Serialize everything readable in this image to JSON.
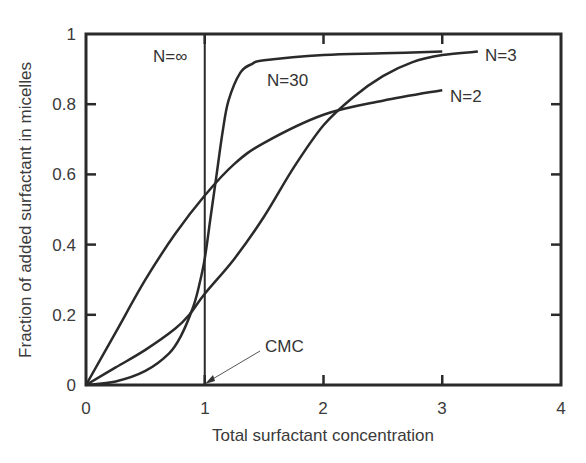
{
  "chart_data": {
    "type": "line",
    "title": "",
    "xlabel": "Total surfactant concentration",
    "ylabel": "Fraction of added surfactant in micelles",
    "xlim": [
      0,
      4
    ],
    "ylim": [
      0,
      1
    ],
    "xticks": [
      "0",
      "1",
      "2",
      "3",
      "4"
    ],
    "yticks": [
      "0",
      "0.2",
      "0.4",
      "0.6",
      "0.8",
      "1"
    ],
    "grid": false,
    "legend": "inline labels",
    "series": [
      {
        "name": "N=2",
        "x": [
          0,
          0.25,
          0.5,
          0.75,
          1.0,
          1.25,
          1.5,
          2.0,
          2.5,
          3.0
        ],
        "y": [
          0,
          0.15,
          0.3,
          0.43,
          0.54,
          0.63,
          0.69,
          0.77,
          0.81,
          0.84
        ]
      },
      {
        "name": "N=3",
        "x": [
          0,
          0.25,
          0.5,
          0.75,
          0.87,
          1.0,
          1.25,
          1.5,
          1.75,
          2.0,
          2.25,
          2.5,
          2.75,
          3.0,
          3.3
        ],
        "y": [
          0,
          0.05,
          0.1,
          0.16,
          0.2,
          0.26,
          0.36,
          0.48,
          0.62,
          0.74,
          0.82,
          0.88,
          0.92,
          0.94,
          0.95
        ]
      },
      {
        "name": "N=30",
        "x": [
          0,
          0.25,
          0.5,
          0.7,
          0.8,
          0.9,
          0.95,
          1.0,
          1.05,
          1.1,
          1.15,
          1.2,
          1.3,
          1.4,
          1.5,
          2.0,
          2.5,
          3.0
        ],
        "y": [
          0,
          0.01,
          0.04,
          0.09,
          0.14,
          0.22,
          0.28,
          0.36,
          0.48,
          0.6,
          0.72,
          0.81,
          0.89,
          0.915,
          0.925,
          0.94,
          0.945,
          0.95
        ]
      },
      {
        "name": "N=∞",
        "x": [
          0,
          1,
          1
        ],
        "y": [
          0,
          0,
          1
        ]
      }
    ],
    "annotations": [
      {
        "text": "N=∞",
        "x": 0.66,
        "y": 0.92
      },
      {
        "text": "N=30",
        "x": 1.7,
        "y": 0.89
      },
      {
        "text": "N=3",
        "x": 3.5,
        "y": 0.94
      },
      {
        "text": "N=2",
        "x": 3.2,
        "y": 0.83
      },
      {
        "text": "CMC",
        "x": 1.5,
        "y": 0.11,
        "arrow_to": [
          1.0,
          0.0
        ]
      }
    ]
  },
  "labels": {
    "xlabel": "Total surfactant concentration",
    "ylabel": "Fraction of added surfactant in micelles",
    "n_inf": "N=∞",
    "n_30": "N=30",
    "n_3": "N=3",
    "n_2": "N=2",
    "cmc": "CMC"
  },
  "ticks": {
    "x": [
      "0",
      "1",
      "2",
      "3",
      "4"
    ],
    "y": [
      "0",
      "0.2",
      "0.4",
      "0.6",
      "0.8",
      "1"
    ]
  }
}
